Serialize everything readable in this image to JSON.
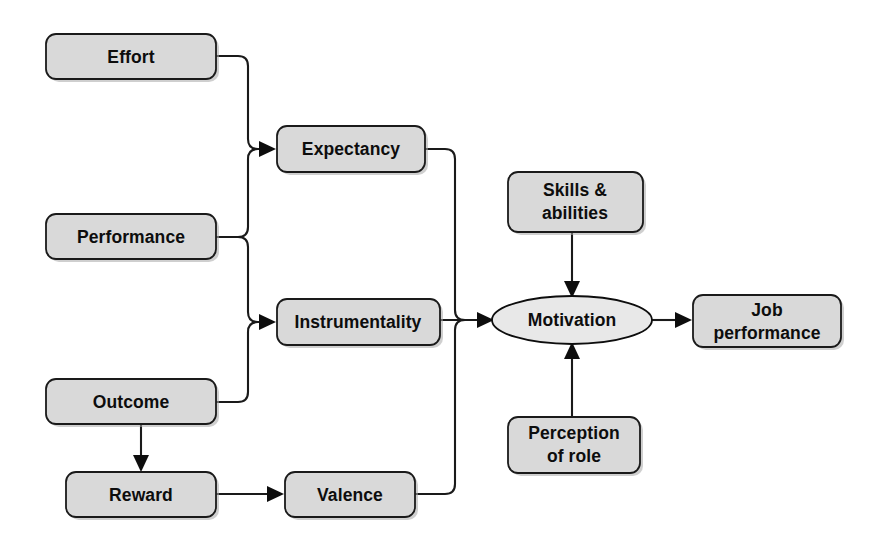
{
  "diagram": {
    "background_color": "#ffffff",
    "node_fill_color": "#d9d9d9",
    "ellipse_fill_color": "#e8e8e8",
    "line_color": "#1a1a1a",
    "text_color": "#0d0d0d",
    "nodes": [
      {
        "id": "effort",
        "label": "Effort",
        "shape": "rounded-rect",
        "x": 46,
        "y": 34,
        "w": 170,
        "h": 45
      },
      {
        "id": "performance",
        "label": "Performance",
        "shape": "rounded-rect",
        "x": 46,
        "y": 214,
        "w": 170,
        "h": 45
      },
      {
        "id": "outcome",
        "label": "Outcome",
        "shape": "rounded-rect",
        "x": 46,
        "y": 379,
        "w": 170,
        "h": 45
      },
      {
        "id": "reward",
        "label": "Reward",
        "shape": "rounded-rect",
        "x": 66,
        "y": 472,
        "w": 150,
        "h": 45
      },
      {
        "id": "expectancy",
        "label": "Expectancy",
        "shape": "rounded-rect",
        "x": 277,
        "y": 126,
        "w": 148,
        "h": 46
      },
      {
        "id": "instrumentality",
        "label": "Instrumentality",
        "shape": "rounded-rect",
        "x": 277,
        "y": 299,
        "w": 163,
        "h": 46
      },
      {
        "id": "valence",
        "label": "Valence",
        "shape": "rounded-rect",
        "x": 285,
        "y": 472,
        "w": 130,
        "h": 45
      },
      {
        "id": "skills-abilities",
        "label": "Skills &\nabilities",
        "line1": "Skills &",
        "line2": "abilities",
        "shape": "rounded-rect",
        "x": 508,
        "y": 172,
        "w": 135,
        "h": 60
      },
      {
        "id": "motivation",
        "label": "Motivation",
        "shape": "ellipse",
        "cx": 572,
        "cy": 320,
        "rx": 80,
        "ry": 24
      },
      {
        "id": "perception-of-role",
        "label": "Perception\nof role",
        "line1": "Perception",
        "line2": "of role",
        "shape": "rounded-rect",
        "x": 508,
        "y": 417,
        "w": 132,
        "h": 56
      },
      {
        "id": "job-performance",
        "label": "Job\nperformance",
        "line1": "Job",
        "line2": "performance",
        "shape": "rounded-rect",
        "x": 693,
        "y": 295,
        "w": 148,
        "h": 52
      }
    ],
    "edges": [
      {
        "id": "effort-to-expectancy",
        "from": "effort",
        "to": "expectancy",
        "arrow": true
      },
      {
        "id": "performance-to-expectancy",
        "from": "performance",
        "to": "expectancy",
        "arrow": true
      },
      {
        "id": "performance-to-instrumentality",
        "from": "performance",
        "to": "instrumentality",
        "arrow": true
      },
      {
        "id": "outcome-to-instrumentality",
        "from": "outcome",
        "to": "instrumentality",
        "arrow": true
      },
      {
        "id": "outcome-to-reward",
        "from": "outcome",
        "to": "reward",
        "arrow": true
      },
      {
        "id": "reward-to-valence",
        "from": "reward",
        "to": "valence",
        "arrow": true
      },
      {
        "id": "expectancy-to-motivation",
        "from": "expectancy",
        "to": "motivation",
        "arrow": true
      },
      {
        "id": "instrumentality-to-motivation",
        "from": "instrumentality",
        "to": "motivation",
        "arrow": true
      },
      {
        "id": "valence-to-motivation",
        "from": "valence",
        "to": "motivation",
        "arrow": true
      },
      {
        "id": "skills-to-motivation",
        "from": "skills-abilities",
        "to": "motivation",
        "arrow": true
      },
      {
        "id": "perception-to-motivation",
        "from": "perception-of-role",
        "to": "motivation",
        "arrow": true
      },
      {
        "id": "motivation-to-job-performance",
        "from": "motivation",
        "to": "job-performance",
        "arrow": true
      }
    ]
  }
}
